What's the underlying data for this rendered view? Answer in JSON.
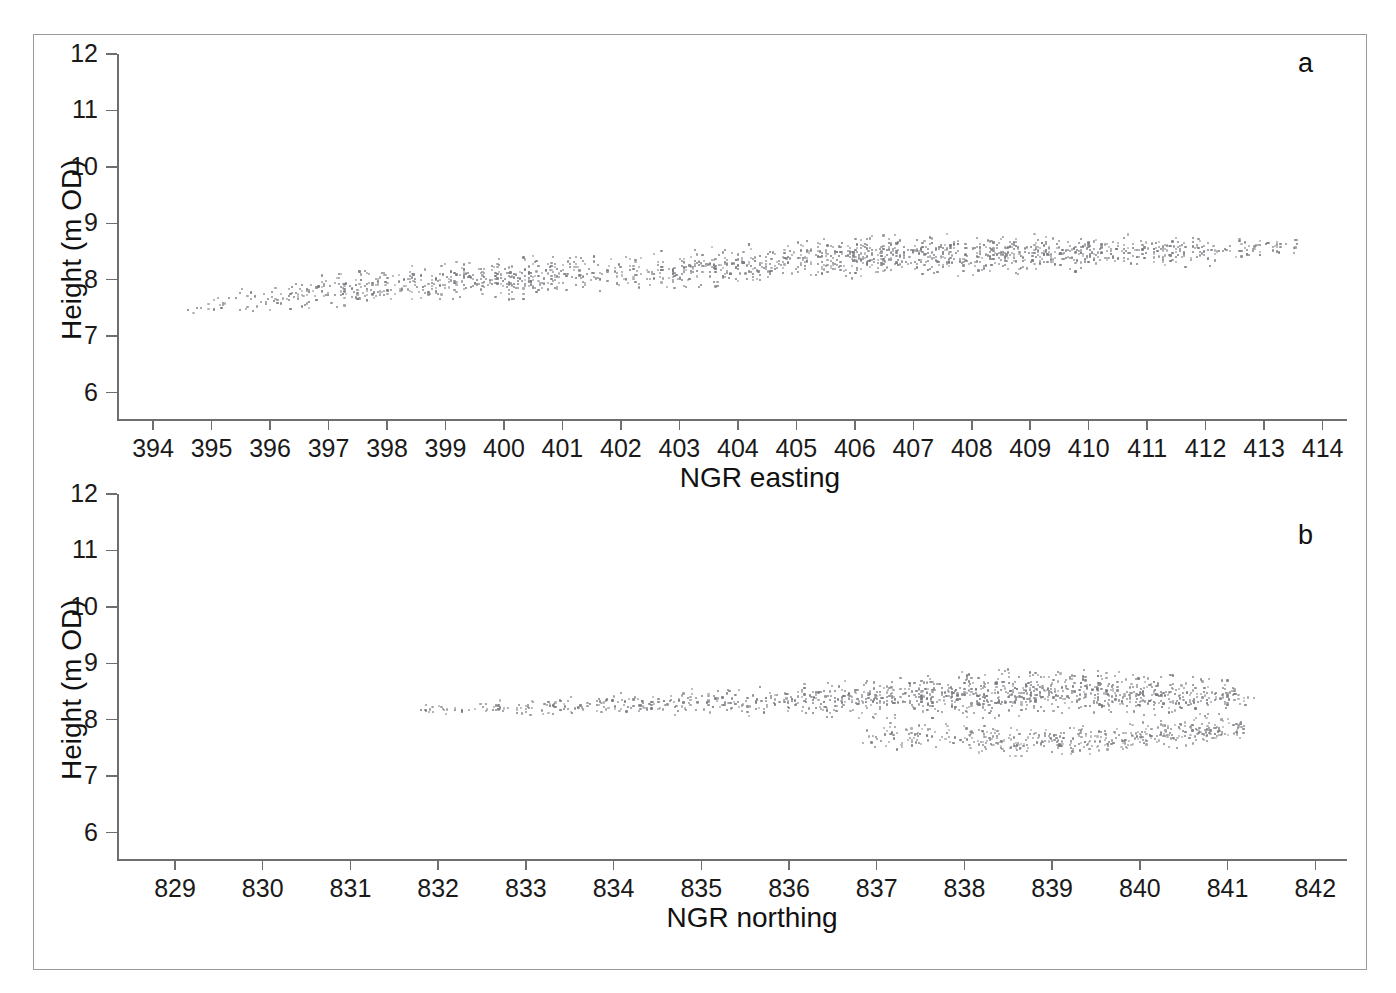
{
  "figure": {
    "panels": [
      {
        "key": "a",
        "letter": "a",
        "xlabel": "NGR easting",
        "ylabel": "Height (m OD)",
        "xticks": [
          "394",
          "395",
          "396",
          "397",
          "398",
          "399",
          "400",
          "401",
          "402",
          "403",
          "404",
          "405",
          "406",
          "407",
          "408",
          "409",
          "410",
          "411",
          "412",
          "413",
          "414"
        ],
        "yticks": [
          "12",
          "11",
          "10",
          "9",
          "8",
          "7",
          "6"
        ]
      },
      {
        "key": "b",
        "letter": "b",
        "xlabel": "NGR northing",
        "ylabel": "Height (m OD)",
        "xticks": [
          "829",
          "830",
          "831",
          "832",
          "833",
          "834",
          "835",
          "836",
          "837",
          "838",
          "839",
          "840",
          "841",
          "842"
        ],
        "yticks": [
          "12",
          "11",
          "10",
          "9",
          "8",
          "7",
          "6"
        ]
      }
    ],
    "colors": {
      "point": "#7a7a80",
      "axis": "#6e6e6e",
      "frame": "#9a9a9a",
      "text": "#111111"
    }
  },
  "chart_data": [
    {
      "type": "scatter",
      "panel": "a",
      "title": "",
      "xlabel": "NGR easting",
      "ylabel": "Height (m OD)",
      "xlim": [
        393.4,
        414.4
      ],
      "ylim": [
        5.55,
        12.0
      ],
      "xticks": [
        394,
        395,
        396,
        397,
        398,
        399,
        400,
        401,
        402,
        403,
        404,
        405,
        406,
        407,
        408,
        409,
        410,
        411,
        412,
        413,
        414
      ],
      "yticks": [
        6,
        7,
        8,
        9,
        10,
        11,
        12
      ],
      "grid": false,
      "legend": null,
      "n_points": 1700,
      "marker": {
        "shape": "circle",
        "size_px": 2.2,
        "color": "#7a7a80"
      },
      "description": "Dense band of survey points rising gently left-to-right; height increases from about 7.4 m OD near easting 394.5 to about 8.6 m OD near easting 413.6. Band thickness roughly 0.5-0.9 m. Point density low below easting 396, increasing markedly east of 405.",
      "x_range_data": [
        394.5,
        413.6
      ],
      "trend": {
        "x": [
          394.5,
          396,
          398,
          400,
          402,
          404,
          406,
          408,
          410,
          412,
          413.6
        ],
        "y_center": [
          7.45,
          7.72,
          7.88,
          8.02,
          8.13,
          8.26,
          8.4,
          8.44,
          8.48,
          8.52,
          8.56
        ],
        "y_spread": [
          0.1,
          0.2,
          0.26,
          0.3,
          0.3,
          0.28,
          0.3,
          0.3,
          0.26,
          0.22,
          0.16
        ]
      },
      "density_profile": {
        "x": [
          394.5,
          396,
          398,
          400,
          402,
          404,
          406,
          408,
          410,
          412,
          413.6
        ],
        "weight": [
          0.1,
          0.35,
          0.7,
          0.85,
          0.55,
          0.75,
          1.0,
          0.95,
          0.85,
          0.55,
          0.2
        ]
      }
    },
    {
      "type": "scatter",
      "panel": "b",
      "title": "",
      "xlabel": "NGR northing",
      "ylabel": "Height (m OD)",
      "xlim": [
        828.35,
        842.35
      ],
      "ylim": [
        5.55,
        12.0
      ],
      "xticks": [
        829,
        830,
        831,
        832,
        833,
        834,
        835,
        836,
        837,
        838,
        839,
        840,
        841,
        842
      ],
      "yticks": [
        6,
        7,
        8,
        9,
        10,
        11,
        12
      ],
      "grid": false,
      "legend": null,
      "n_points": 1700,
      "marker": {
        "shape": "circle",
        "size_px": 2.2,
        "color": "#7a7a80"
      },
      "description": "Near-horizontal band of survey points centred about 8.2-8.5 m OD spanning northing 831.8 to 841.3. West of 837 the band is thin and sparse; east of 837 it broadens and splits into a dense upper band near 8.5 m OD and a lower branch near 7.6-7.9 m OD.",
      "x_range_data": [
        831.8,
        841.3
      ],
      "trend": {
        "x": [
          831.8,
          833,
          834,
          835,
          836,
          837,
          838,
          839,
          840,
          841,
          841.3
        ],
        "y_center": [
          8.18,
          8.22,
          8.26,
          8.32,
          8.36,
          8.4,
          8.45,
          8.48,
          8.46,
          8.4,
          8.35
        ],
        "y_spread": [
          0.07,
          0.12,
          0.16,
          0.2,
          0.24,
          0.3,
          0.34,
          0.34,
          0.3,
          0.24,
          0.14
        ]
      },
      "lower_branch": {
        "x_start": 836.8,
        "x_end": 841.2,
        "y": [
          7.72,
          7.66,
          7.62,
          7.66,
          7.74,
          7.86
        ],
        "x": [
          836.8,
          837.8,
          838.6,
          839.4,
          840.3,
          841.2
        ],
        "y_spread": 0.2
      },
      "density_profile": {
        "x": [
          831.8,
          833,
          834,
          835,
          836,
          837,
          838,
          839,
          840,
          841,
          841.3
        ],
        "weight": [
          0.12,
          0.22,
          0.28,
          0.3,
          0.45,
          0.7,
          0.95,
          1.0,
          0.8,
          0.45,
          0.15
        ]
      }
    }
  ]
}
